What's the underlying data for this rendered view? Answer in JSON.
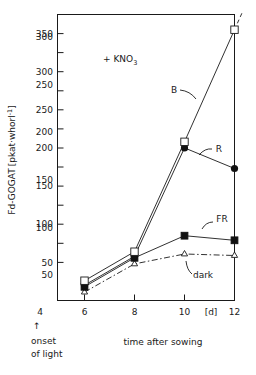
{
  "chart_data": {
    "type": "line",
    "title": "",
    "annotation": "+ KNO3",
    "annotation_base": "+ KNO",
    "annotation_sub": "3",
    "xlabel": "time after sowing",
    "xunit": "[d]",
    "ylabel_prefix": "Fd-GOGAT",
    "ylabel_unit": "[pkat·whorl",
    "ylabel_exp": "-1",
    "ylabel_close": "]",
    "ylabel_full": "Fd-GOGAT [pkat·whorl-1]",
    "xlim": [
      4.6,
      12.6
    ],
    "ylim": [
      0,
      375
    ],
    "xticks": [
      6,
      8,
      10,
      12
    ],
    "xtick_labels": [
      "6",
      "8",
      "10",
      "12"
    ],
    "x_extra_tick_label": "4",
    "yticks": [
      50,
      100,
      150,
      200,
      250,
      300,
      350
    ],
    "ytick_labels": [
      "50",
      "100",
      "150",
      "200",
      "250",
      "300",
      "350"
    ],
    "grid": false,
    "legend": "inline-labels",
    "onset_marker": {
      "arrow": "↑",
      "line1": "onset",
      "line2": "of light"
    },
    "series": [
      {
        "name": "B",
        "label": "B",
        "marker": "open-square",
        "linestyle": "solid",
        "x": [
          6,
          8,
          10,
          12
        ],
        "values": [
          26,
          64,
          208,
          355
        ],
        "extrapolation": {
          "x": [
            12,
            12.55
          ],
          "values": [
            355,
            395
          ],
          "linestyle": "dashed"
        }
      },
      {
        "name": "R",
        "label": "R",
        "marker": "filled-circle",
        "linestyle": "solid",
        "x": [
          6,
          8,
          10,
          12
        ],
        "values": [
          20,
          58,
          200,
          173
        ]
      },
      {
        "name": "FR",
        "label": "FR",
        "marker": "filled-square",
        "linestyle": "solid",
        "x": [
          6,
          8,
          10,
          12
        ],
        "values": [
          18,
          56,
          85,
          79
        ]
      },
      {
        "name": "dark",
        "label": "dark",
        "marker": "open-triangle",
        "linestyle": "dash-dot",
        "x": [
          6,
          8,
          10,
          12
        ],
        "values": [
          11,
          48,
          61,
          59
        ]
      }
    ]
  }
}
